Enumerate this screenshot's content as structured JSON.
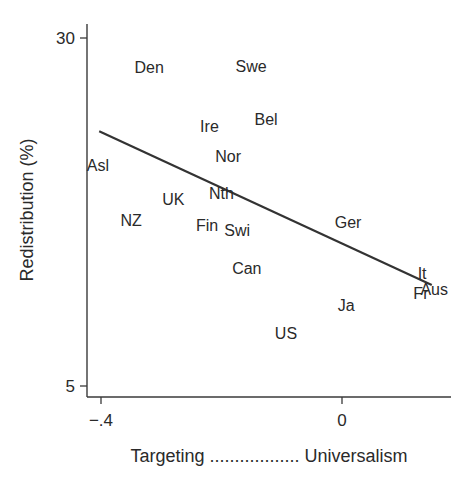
{
  "chart_data": {
    "type": "scatter",
    "title": "",
    "xlabel": "Targeting .................. Universalism",
    "ylabel": "Redistribution (%)",
    "xlim": [
      -0.42,
      0.18
    ],
    "ylim": [
      4.2,
      31
    ],
    "x_ticks": [
      {
        "value": -0.4,
        "label": "-.4"
      },
      {
        "value": 0,
        "label": "0"
      }
    ],
    "y_ticks": [
      {
        "value": 5,
        "label": "5"
      },
      {
        "value": 30,
        "label": "30"
      }
    ],
    "grid": false,
    "legend": null,
    "marker": "country-label",
    "points": [
      {
        "label": "Den",
        "x": -0.32,
        "y": 27.9
      },
      {
        "label": "Swe",
        "x": -0.151,
        "y": 28.0
      },
      {
        "label": "Ire",
        "x": -0.22,
        "y": 23.7
      },
      {
        "label": "Bel",
        "x": -0.126,
        "y": 24.2
      },
      {
        "label": "Nor",
        "x": -0.189,
        "y": 21.5
      },
      {
        "label": "Asl",
        "x": -0.405,
        "y": 20.9
      },
      {
        "label": "Nth",
        "x": -0.2,
        "y": 18.9
      },
      {
        "label": "UK",
        "x": -0.28,
        "y": 18.4
      },
      {
        "label": "NZ",
        "x": -0.35,
        "y": 16.9
      },
      {
        "label": "Fin",
        "x": -0.224,
        "y": 16.6
      },
      {
        "label": "Swi",
        "x": -0.174,
        "y": 16.2
      },
      {
        "label": "Ger",
        "x": 0.01,
        "y": 16.8
      },
      {
        "label": "Can",
        "x": -0.158,
        "y": 13.5
      },
      {
        "label": "It",
        "x": 0.133,
        "y": 13.1
      },
      {
        "label": "Aus",
        "x": 0.153,
        "y": 12.0
      },
      {
        "label": "Fr",
        "x": 0.131,
        "y": 11.7
      },
      {
        "label": "Ja",
        "x": 0.007,
        "y": 10.8
      },
      {
        "label": "US",
        "x": -0.093,
        "y": 8.8
      }
    ],
    "fit_line": {
      "type": "linear",
      "x0": -0.403,
      "y0": 23.3,
      "x1": 0.149,
      "y1": 12.26
    },
    "colors": {
      "text": "#2a2a2a",
      "axis": "#3a3a3a",
      "line": "#333333",
      "background": "#ffffff"
    }
  }
}
